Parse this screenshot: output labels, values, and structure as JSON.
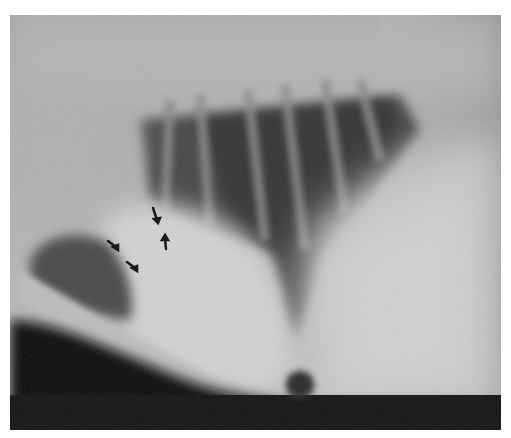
{
  "image": {
    "type": "radiograph",
    "view": "lateral thoracic radiograph",
    "annotations": {
      "arrows": [
        {
          "id": "arrow-1",
          "x": 155,
          "y": 215,
          "direction": "down"
        },
        {
          "id": "arrow-2",
          "x": 112,
          "y": 244,
          "direction": "down-right"
        },
        {
          "id": "arrow-3",
          "x": 131,
          "y": 265,
          "direction": "down-right"
        },
        {
          "id": "arrow-4",
          "x": 165,
          "y": 242,
          "direction": "up"
        }
      ],
      "arrow_color": "#1a1a1a"
    },
    "tones": {
      "background": "#9a9a9a",
      "lung_dark": "#3a3a3a",
      "bright_soft_tissue": "#d8d8d8",
      "abdomen_dark": "#0a0a0a"
    }
  }
}
